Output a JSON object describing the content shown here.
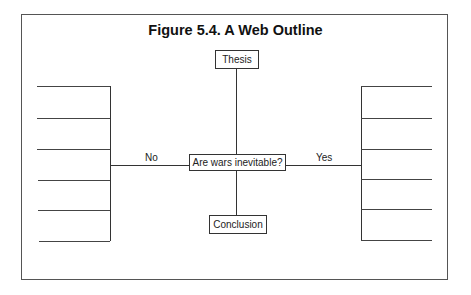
{
  "figure": {
    "title": "Figure 5.4.  A Web Outline",
    "nodes": {
      "top": "Thesis",
      "center": "Are wars inevitable?",
      "bottom": "Conclusion"
    },
    "branches": {
      "left": {
        "label": "No",
        "blank_lines": 6
      },
      "right": {
        "label": "Yes",
        "blank_lines": 6
      }
    }
  }
}
